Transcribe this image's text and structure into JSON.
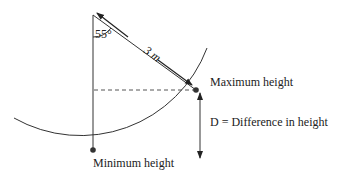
{
  "diagram": {
    "type": "pendulum",
    "angle_label": "55°",
    "length_label": "3 m",
    "max_label": "Maximum height",
    "min_label": "Minimum height",
    "difference_label": "D = Difference in height",
    "line_color": "#333333",
    "dash_color": "#555555"
  }
}
